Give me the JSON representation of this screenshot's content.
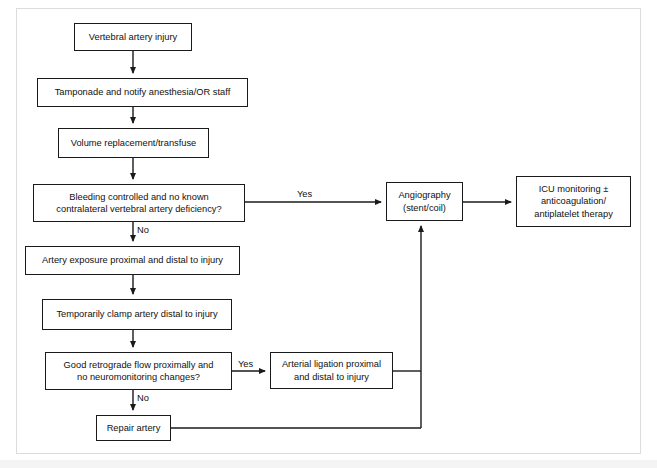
{
  "figure": {
    "type": "flowchart",
    "orientation": "top-to-bottom",
    "frame_color": "#dcdcdc",
    "box_border_color": "#1a1a1a",
    "line_color": "#1a1a1a",
    "background": "#ffffff"
  },
  "nodes": [
    {
      "id": "vertebral-artery-injury",
      "label": "Vertebral artery injury",
      "shape": "rect",
      "x": 74,
      "y": 23,
      "w": 118,
      "h": 28
    },
    {
      "id": "tamponade-notify",
      "label": "Tamponade and notify anesthesia/OR staff",
      "shape": "rect",
      "x": 37,
      "y": 78,
      "w": 211,
      "h": 29
    },
    {
      "id": "volume-replacement",
      "label": "Volume replacement/transfuse",
      "shape": "rect",
      "x": 58,
      "y": 128,
      "w": 151,
      "h": 30
    },
    {
      "id": "bleeding-controlled-decision",
      "label": "Bleeding controlled and no known contralateral vertebral artery deficiency?",
      "shape": "rect",
      "x": 33,
      "y": 184,
      "w": 212,
      "h": 38
    },
    {
      "id": "artery-exposure",
      "label": "Artery exposure proximal and distal to injury",
      "shape": "rect",
      "x": 25,
      "y": 246,
      "w": 215,
      "h": 29
    },
    {
      "id": "temporarily-clamp",
      "label": "Temporarily clamp artery distal to injury",
      "shape": "rect",
      "x": 42,
      "y": 299,
      "w": 190,
      "h": 31
    },
    {
      "id": "retrograde-flow-decision",
      "label": "Good retrograde flow proximally and no neuromonitoring changes?",
      "shape": "rect",
      "x": 45,
      "y": 352,
      "w": 187,
      "h": 38
    },
    {
      "id": "repair-artery",
      "label": "Repair artery",
      "shape": "rect",
      "x": 96,
      "y": 415,
      "w": 75,
      "h": 26
    },
    {
      "id": "arterial-ligation",
      "label": "Arterial ligation proximal and distal to injury",
      "shape": "rect",
      "x": 270,
      "y": 352,
      "w": 123,
      "h": 37
    },
    {
      "id": "angiography",
      "label": "Angiography (stent/coil)",
      "shape": "rect",
      "x": 386,
      "y": 182,
      "w": 77,
      "h": 39
    },
    {
      "id": "icu-monitoring",
      "label": "ICU monitoring ± anticoagulation/ antiplatelet therapy",
      "shape": "rect",
      "x": 516,
      "y": 176,
      "w": 115,
      "h": 51
    }
  ],
  "node_text": {
    "vertebral_artery_injury": "Vertebral artery injury",
    "tamponade_notify": "Tamponade and notify anesthesia/OR staff",
    "volume_replacement": "Volume replacement/transfuse",
    "bleeding_decision_line1": "Bleeding controlled and no known",
    "bleeding_decision_line2": "contralateral vertebral artery deficiency?",
    "artery_exposure": "Artery exposure proximal and distal to injury",
    "temporarily_clamp": "Temporarily clamp artery distal to injury",
    "retrograde_decision_line1": "Good retrograde flow proximally and",
    "retrograde_decision_line2": "no neuromonitoring changes?",
    "repair_artery": "Repair artery",
    "arterial_ligation_line1": "Arterial ligation proximal",
    "arterial_ligation_line2": "and distal to injury",
    "angiography_line1": "Angiography",
    "angiography_line2": "(stent/coil)",
    "icu_line1": "ICU monitoring ±",
    "icu_line2": "anticoagulation/",
    "icu_line3": "antiplatelet therapy"
  },
  "edge_labels": {
    "bleeding_yes": "Yes",
    "bleeding_no": "No",
    "retrograde_yes": "Yes",
    "retrograde_no": "No"
  },
  "edges": [
    {
      "from": "vertebral-artery-injury",
      "to": "tamponade-notify",
      "label": ""
    },
    {
      "from": "tamponade-notify",
      "to": "volume-replacement",
      "label": ""
    },
    {
      "from": "volume-replacement",
      "to": "bleeding-controlled-decision",
      "label": ""
    },
    {
      "from": "bleeding-controlled-decision",
      "to": "angiography",
      "label": "Yes"
    },
    {
      "from": "bleeding-controlled-decision",
      "to": "artery-exposure",
      "label": "No"
    },
    {
      "from": "artery-exposure",
      "to": "temporarily-clamp",
      "label": ""
    },
    {
      "from": "temporarily-clamp",
      "to": "retrograde-flow-decision",
      "label": ""
    },
    {
      "from": "retrograde-flow-decision",
      "to": "arterial-ligation",
      "label": "Yes"
    },
    {
      "from": "retrograde-flow-decision",
      "to": "repair-artery",
      "label": "No"
    },
    {
      "from": "arterial-ligation",
      "to": "angiography",
      "label": ""
    },
    {
      "from": "repair-artery",
      "to": "angiography",
      "label": ""
    },
    {
      "from": "angiography",
      "to": "icu-monitoring",
      "label": ""
    }
  ]
}
